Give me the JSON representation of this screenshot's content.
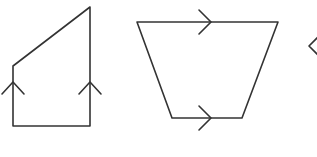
{
  "diagram": {
    "description": "Three quadrilaterals with parallel-side arrow markings",
    "stroke_color": "#333333",
    "background": "#ffffff",
    "shapes": [
      {
        "name": "right-trapezoid",
        "label": "Shape with vertical parallel sides",
        "points": [
          [
            13,
            66
          ],
          [
            90,
            7
          ],
          [
            90,
            126
          ],
          [
            13,
            126
          ]
        ],
        "parallel_marks": [
          {
            "x": 13,
            "y": 84,
            "direction": "up"
          },
          {
            "x": 90,
            "y": 84,
            "direction": "up"
          }
        ]
      },
      {
        "name": "isosceles-trapezoid",
        "label": "Shape with horizontal parallel sides",
        "points": [
          [
            137,
            22
          ],
          [
            278,
            22
          ],
          [
            242,
            118
          ],
          [
            172,
            118
          ]
        ],
        "parallel_marks": [
          {
            "x": 208,
            "y": 22,
            "direction": "right"
          },
          {
            "x": 208,
            "y": 118,
            "direction": "right"
          }
        ]
      },
      {
        "name": "partial-shape",
        "label": "Partially visible shape at right edge",
        "parallel_marks": [
          {
            "x": 309,
            "y": 46,
            "direction": "left"
          }
        ]
      }
    ]
  }
}
